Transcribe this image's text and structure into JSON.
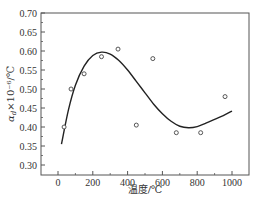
{
  "chart_data": {
    "type": "scatter",
    "title": "",
    "xlabel": "温度/℃",
    "ylabel": "α_d × 10⁻⁶/℃",
    "xlim": [
      -100,
      1100
    ],
    "ylim": [
      0.28,
      0.7
    ],
    "xticks": [
      0,
      200,
      400,
      600,
      800,
      1000
    ],
    "yticks": [
      0.3,
      0.35,
      0.4,
      0.45,
      0.5,
      0.55,
      0.6,
      0.65,
      0.7
    ],
    "grid": false,
    "legend": null,
    "series": [
      {
        "name": "measured",
        "type": "scatter",
        "marker": "open-circle",
        "x": [
          35,
          75,
          150,
          250,
          345,
          450,
          545,
          680,
          820,
          960
        ],
        "y": [
          0.4,
          0.5,
          0.54,
          0.585,
          0.605,
          0.405,
          0.58,
          0.385,
          0.385,
          0.48
        ]
      },
      {
        "name": "fit",
        "type": "line",
        "x": [
          20,
          60,
          100,
          150,
          200,
          250,
          300,
          350,
          400,
          450,
          500,
          550,
          600,
          650,
          700,
          750,
          800,
          850,
          900,
          950,
          1000
        ],
        "y": [
          0.355,
          0.445,
          0.51,
          0.56,
          0.588,
          0.597,
          0.592,
          0.575,
          0.55,
          0.52,
          0.49,
          0.46,
          0.435,
          0.415,
          0.402,
          0.398,
          0.401,
          0.41,
          0.42,
          0.43,
          0.442
        ]
      }
    ]
  },
  "axes": {
    "xlabel": "温度/℃",
    "ylabel_alpha": "α",
    "ylabel_sub": "d",
    "ylabel_rest": "×10⁻⁶/℃",
    "xtick_labels": [
      "0",
      "200",
      "400",
      "600",
      "800",
      "1000"
    ],
    "ytick_labels": [
      "0.30",
      "0.35",
      "0.40",
      "0.45",
      "0.50",
      "0.55",
      "0.60",
      "0.65",
      "0.70"
    ]
  }
}
